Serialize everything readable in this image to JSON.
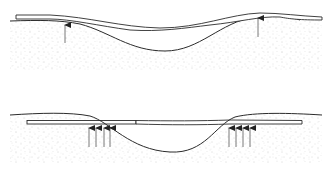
{
  "diagram": {
    "title": "Beam on elastic foundation over a ground depression",
    "colors": {
      "line": "#2b2b2b",
      "arrow": "#555555",
      "soil_speckle": "#9a9a9a",
      "background": "#ffffff"
    },
    "panels": [
      {
        "id": "top",
        "label": "Flexible plank conforming to depression, supported at ends",
        "support_arrows_x": [
          65,
          258
        ],
        "arrow_count": 2
      },
      {
        "id": "bottom",
        "label": "Rigid plank bridging depression, supported by groups of arrows near edges",
        "support_arrows_x": [
          89,
          96,
          104,
          110,
          229,
          236,
          243,
          250
        ],
        "arrow_count": 8
      }
    ]
  }
}
